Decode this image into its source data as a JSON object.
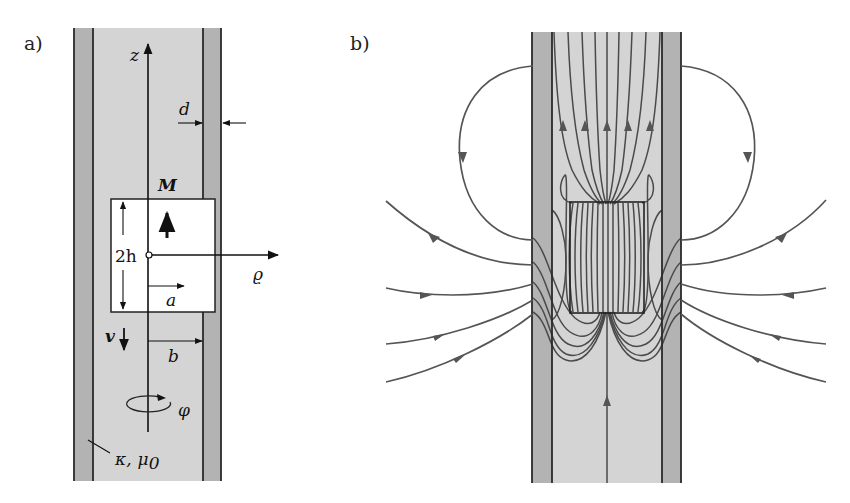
{
  "figure": {
    "width": 850,
    "height": 503,
    "colors": {
      "background": "#ffffff",
      "tube_wall": "#b3b3b3",
      "tube_interior": "#d4d4d4",
      "magnet_fill": "#ffffff",
      "edge_lines": "#2a2a2a",
      "field_lines": "#555555",
      "text": "#111111"
    }
  },
  "panel_a": {
    "label": "a)",
    "tube": {
      "outer_left_x": 74,
      "inner_left_x": 93,
      "inner_right_x": 203,
      "outer_right_x": 221,
      "top_y": 28,
      "bottom_y": 481
    },
    "magnet": {
      "x": 111,
      "y": 199,
      "width": 104,
      "height": 113
    },
    "labels": {
      "z_axis": "z",
      "wall_thickness": "d",
      "magnetization": "M",
      "magnet_height": "2h",
      "radial_axis": "ϱ",
      "inner_radius": "a",
      "velocity": "v",
      "tube_radius": "b",
      "azimuth": "φ",
      "conductivity": "κ",
      "permeability": "μ",
      "permeability_subscript": "0",
      "material_separator": ","
    }
  },
  "panel_b": {
    "label": "b)",
    "tube": {
      "outer_left_x": 532,
      "inner_left_x": 552,
      "inner_right_x": 662,
      "outer_right_x": 681,
      "top_y": 32,
      "bottom_y": 483
    },
    "magnet": {
      "x": 570,
      "y": 202,
      "width": 74,
      "height": 111
    },
    "description": "Magnetic field lines of a cylindrical permanent magnet moving inside a conducting tube"
  }
}
